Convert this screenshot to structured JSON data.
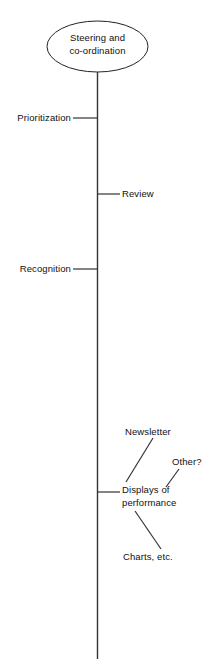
{
  "diagram": {
    "type": "vertical-spine-tree",
    "background_color": "#ffffff",
    "line_color": "#222222",
    "text_color": "#111111",
    "root": {
      "label_line_1": "Steering and",
      "label_line_2": "co-ordination",
      "shape": "ellipse"
    },
    "branches": [
      {
        "label": "Prioritization",
        "side": "left"
      },
      {
        "label": "Review",
        "side": "right"
      },
      {
        "label": "Recognition",
        "side": "left"
      },
      {
        "label_line_1": "Displays of",
        "label_line_2": "performance",
        "side": "right"
      }
    ],
    "sub_branches": [
      {
        "label": "Newsletter",
        "parent": "Displays of performance"
      },
      {
        "label": "Other?",
        "parent": "Displays of performance"
      },
      {
        "label": "Charts, etc.",
        "parent": "Displays of performance"
      }
    ]
  }
}
